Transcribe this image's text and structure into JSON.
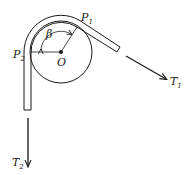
{
  "diagram": {
    "type": "belt-friction-pulley",
    "colors": {
      "stroke": "#1a1a1a",
      "background": "#ffffff"
    },
    "labels": {
      "P1": {
        "main": "P",
        "sub": "1"
      },
      "P2": {
        "main": "P",
        "sub": "2"
      },
      "O": {
        "main": "O"
      },
      "beta": {
        "main": "β"
      },
      "T1": {
        "main": "T",
        "sub": "1"
      },
      "T2": {
        "main": "T",
        "sub": "2"
      }
    },
    "elements": [
      "pulley-circle",
      "center-point-O",
      "belt-wrapped-around-pulley",
      "radius-line-to-P1",
      "horizontal-radius-line-to-P2",
      "angle-arc-beta",
      "tension-arrow-T1",
      "tension-arrow-T2"
    ]
  }
}
